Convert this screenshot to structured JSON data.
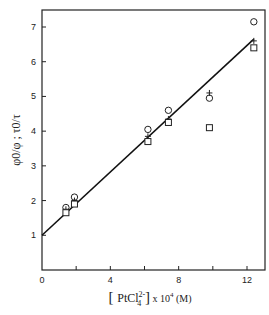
{
  "chart_data": {
    "type": "scatter",
    "title": "",
    "xlabel": "[PtCl4 2-] x 10^4 (M)",
    "xlabel_parts": {
      "open": "[",
      "species": "PtCl",
      "superscript": "2-",
      "subscript": "4",
      "close": "]",
      "suffix": "x 10",
      "exponent": "4",
      "unit": "(M)"
    },
    "ylabel": "φ0/φ ; τ0/τ",
    "xlim": [
      0,
      13
    ],
    "ylim": [
      0,
      7.5
    ],
    "x_ticks": [
      0,
      2,
      4,
      6,
      8,
      10,
      12
    ],
    "x_tick_labels": [
      "0",
      "",
      "4",
      "",
      "8",
      "",
      "12"
    ],
    "y_ticks": [
      1,
      2,
      3,
      4,
      5,
      6,
      7
    ],
    "y_tick_labels": [
      "1",
      "2",
      "3",
      "4",
      "5",
      "6",
      "7"
    ],
    "grid": false,
    "legend": null,
    "x": [
      1.4,
      1.9,
      6.2,
      7.4,
      9.8,
      12.4
    ],
    "series": [
      {
        "name": "circle",
        "marker": "circle",
        "values": [
          1.8,
          2.1,
          4.05,
          4.6,
          4.95,
          7.15
        ]
      },
      {
        "name": "cross",
        "marker": "plus",
        "values": [
          1.75,
          2.0,
          3.85,
          4.35,
          5.1,
          6.6
        ]
      },
      {
        "name": "square",
        "marker": "square",
        "values": [
          1.65,
          1.9,
          3.7,
          4.25,
          4.1,
          6.4
        ]
      }
    ],
    "fit_line": {
      "x": [
        0,
        12.4
      ],
      "y": [
        1.0,
        6.65
      ]
    }
  }
}
